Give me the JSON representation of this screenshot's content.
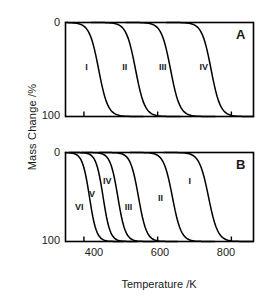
{
  "figure": {
    "axis_titles": {
      "x": "Temperature /K",
      "y": "Mass Change /%"
    },
    "panel_labels": {
      "a": "A",
      "b": "B"
    },
    "y_ticks": [
      "0",
      "100"
    ],
    "x_ticks": [
      "400",
      "600",
      "800"
    ],
    "line_color": "#000000",
    "frame_color": "#000000"
  },
  "chart_data": [
    {
      "type": "line",
      "title": "A",
      "xlabel": "Temperature /K",
      "ylabel": "Mass Change /%",
      "xlim": [
        350,
        860
      ],
      "ylim": [
        0,
        100
      ],
      "y_inverted": true,
      "xticks": [
        400,
        600,
        800
      ],
      "yticks": [
        0,
        100
      ],
      "grid": false,
      "legend": "inline-curve-labels",
      "series": [
        {
          "name": "I",
          "midpoint_K": 440,
          "width_K": 55,
          "label_x_K": 420,
          "label_y_pct": 48
        },
        {
          "name": "II",
          "midpoint_K": 540,
          "width_K": 55,
          "label_x_K": 520,
          "label_y_pct": 48
        },
        {
          "name": "III",
          "midpoint_K": 635,
          "width_K": 55,
          "label_x_K": 620,
          "label_y_pct": 48
        },
        {
          "name": "IV",
          "midpoint_K": 745,
          "width_K": 55,
          "label_x_K": 730,
          "label_y_pct": 48
        }
      ]
    },
    {
      "type": "line",
      "title": "B",
      "xlabel": "Temperature /K",
      "ylabel": "Mass Change /%",
      "xlim": [
        350,
        860
      ],
      "ylim": [
        0,
        100
      ],
      "y_inverted": true,
      "xticks": [
        400,
        600,
        800
      ],
      "yticks": [
        0,
        100
      ],
      "grid": false,
      "legend": "inline-curve-labels",
      "series": [
        {
          "name": "VI",
          "midpoint_K": 415,
          "width_K": 42,
          "label_x_K": 392,
          "label_y_pct": 62
        },
        {
          "name": "V",
          "midpoint_K": 452,
          "width_K": 42,
          "label_x_K": 430,
          "label_y_pct": 48
        },
        {
          "name": "IV",
          "midpoint_K": 492,
          "width_K": 45,
          "label_x_K": 468,
          "label_y_pct": 33
        },
        {
          "name": "III",
          "midpoint_K": 548,
          "width_K": 48,
          "label_x_K": 527,
          "label_y_pct": 62
        },
        {
          "name": "II",
          "midpoint_K": 640,
          "width_K": 52,
          "label_x_K": 617,
          "label_y_pct": 52
        },
        {
          "name": "I",
          "midpoint_K": 738,
          "width_K": 55,
          "label_x_K": 700,
          "label_y_pct": 33
        }
      ]
    }
  ]
}
